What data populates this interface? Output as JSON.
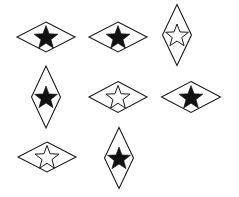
{
  "figure": {
    "width": 239,
    "height": 197,
    "background": "#ffffff",
    "stroke_color": "#1a1a1a",
    "fill_color": "#111111",
    "shapes": [
      {
        "id": 1,
        "orientation": "horizontal",
        "star": "filled",
        "cx": 46,
        "cy": 37,
        "w": 58,
        "h": 30
      },
      {
        "id": 2,
        "orientation": "horizontal",
        "star": "filled",
        "cx": 118,
        "cy": 37,
        "w": 58,
        "h": 30
      },
      {
        "id": 3,
        "orientation": "vertical",
        "star": "outline",
        "cx": 177,
        "cy": 35,
        "w": 29,
        "h": 61
      },
      {
        "id": 4,
        "orientation": "vertical",
        "star": "filled",
        "cx": 46,
        "cy": 97,
        "w": 29,
        "h": 62
      },
      {
        "id": 5,
        "orientation": "horizontal",
        "star": "outline",
        "cx": 118,
        "cy": 97,
        "w": 58,
        "h": 31
      },
      {
        "id": 6,
        "orientation": "horizontal",
        "star": "filled",
        "cx": 191,
        "cy": 97,
        "w": 59,
        "h": 31
      },
      {
        "id": 7,
        "orientation": "horizontal",
        "star": "outline",
        "cx": 47,
        "cy": 157,
        "w": 58,
        "h": 30
      },
      {
        "id": 8,
        "orientation": "vertical",
        "star": "filled",
        "cx": 119,
        "cy": 158,
        "w": 29,
        "h": 61
      }
    ]
  }
}
